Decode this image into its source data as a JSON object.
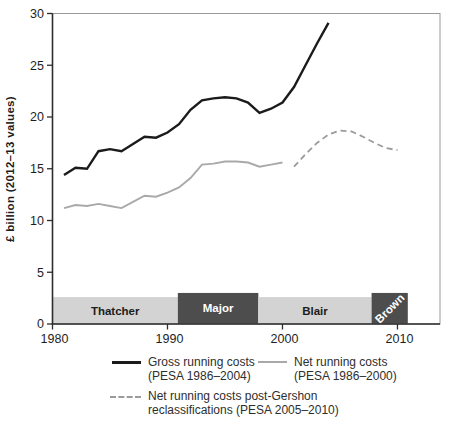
{
  "chart_data": {
    "type": "line",
    "title": "",
    "xlabel": "",
    "ylabel": "£ billion (2012–13 values)",
    "xlim": [
      1980,
      2013.7
    ],
    "ylim": [
      0,
      30
    ],
    "x_ticks": [
      1980,
      1990,
      2000,
      2010
    ],
    "y_ticks": [
      0,
      5,
      10,
      15,
      20,
      25,
      30
    ],
    "grid": false,
    "legend_position": "below",
    "series": [
      {
        "name": "Gross running costs (PESA 1986–2004)",
        "color": "#1b1b1b",
        "width": 2.4,
        "dash": null,
        "x": [
          1981,
          1982,
          1983,
          1984,
          1985,
          1986,
          1987,
          1988,
          1989,
          1990,
          1991,
          1992,
          1993,
          1994,
          1995,
          1996,
          1997,
          1998,
          1999,
          2000,
          2001,
          2002,
          2003,
          2004
        ],
        "values": [
          14.4,
          15.1,
          15.0,
          16.7,
          16.9,
          16.7,
          17.4,
          18.1,
          18.0,
          18.5,
          19.3,
          20.7,
          21.6,
          21.8,
          21.9,
          21.8,
          21.4,
          20.4,
          20.8,
          21.4,
          22.9,
          25.0,
          27.1,
          29.1
        ]
      },
      {
        "name": "Net running costs (PESA 1986–2000)",
        "color": "#a9a9a9",
        "width": 1.9,
        "dash": null,
        "x": [
          1981,
          1982,
          1983,
          1984,
          1985,
          1986,
          1987,
          1988,
          1989,
          1990,
          1991,
          1992,
          1993,
          1994,
          1995,
          1996,
          1997,
          1998,
          1999,
          2000
        ],
        "values": [
          11.2,
          11.5,
          11.4,
          11.6,
          11.4,
          11.2,
          11.8,
          12.4,
          12.3,
          12.7,
          13.2,
          14.1,
          15.4,
          15.5,
          15.7,
          15.7,
          15.6,
          15.2,
          15.4,
          15.6
        ]
      },
      {
        "name": "Net running costs post-Gershon reclassifications (PESA 2005–2010)",
        "color": "#9b9b9b",
        "width": 1.8,
        "dash": "6,4",
        "x": [
          2001,
          2002,
          2003,
          2004,
          2005,
          2006,
          2007,
          2008,
          2009,
          2010
        ],
        "values": [
          15.2,
          16.4,
          17.5,
          18.3,
          18.7,
          18.6,
          18.1,
          17.5,
          17.0,
          16.8
        ]
      }
    ],
    "pm_bands": [
      {
        "label": "Thatcher",
        "start": 1980,
        "end": 1990.9,
        "shade": "light",
        "rotate": 0
      },
      {
        "label": "Major",
        "start": 1990.9,
        "end": 1997.9,
        "shade": "dark",
        "rotate": 0
      },
      {
        "label": "Blair",
        "start": 1997.9,
        "end": 2007.75,
        "shade": "light",
        "rotate": 0
      },
      {
        "label": "Brown",
        "start": 2007.75,
        "end": 2010.9,
        "shade": "dark",
        "rotate": -45
      }
    ],
    "colors": {
      "band_light": "#d3d3d3",
      "band_dark": "#4d4d4d",
      "band_label_light": "#1c1c1c",
      "band_label_dark": "#ffffff",
      "axis": "#2d2d2d",
      "border": "#9a9a9a",
      "tick_label": "#1e1e1e"
    }
  },
  "legend": {
    "items": [
      {
        "label": "Gross running costs",
        "sublabel": "(PESA 1986–2004)",
        "swatch": "gross"
      },
      {
        "label": "Net running costs",
        "sublabel": "(PESA 1986–2000)",
        "swatch": "net"
      },
      {
        "label": "Net running costs post-Gershon",
        "sublabel": "reclassifications (PESA 2005–2010)",
        "swatch": "gershon"
      }
    ]
  }
}
